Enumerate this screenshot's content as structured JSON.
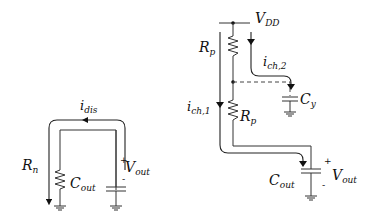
{
  "diagram": {
    "title": "",
    "left_circuit": {
      "name": "discharge-circuit",
      "resistor": {
        "symbol": "R",
        "sub": "n"
      },
      "capacitor": {
        "symbol": "C",
        "sub": "out"
      },
      "current": {
        "symbol": "i",
        "sub": "dis"
      },
      "voltage": {
        "symbol": "V",
        "sub": "out",
        "plus": "+",
        "minus": "-"
      }
    },
    "right_circuit": {
      "name": "charge-circuit",
      "supply": {
        "symbol": "V",
        "sub": "DD"
      },
      "resistor_top": {
        "symbol": "R",
        "sub": "p"
      },
      "resistor_bottom": {
        "symbol": "R",
        "sub": "p"
      },
      "current_1": {
        "symbol": "i",
        "sub": "ch,1"
      },
      "current_2": {
        "symbol": "i",
        "sub": "ch,2"
      },
      "cap_y": {
        "symbol": "C",
        "sub": "y"
      },
      "capacitor": {
        "symbol": "C",
        "sub": "out"
      },
      "voltage": {
        "symbol": "V",
        "sub": "out",
        "plus": "+",
        "minus": "-"
      }
    }
  }
}
